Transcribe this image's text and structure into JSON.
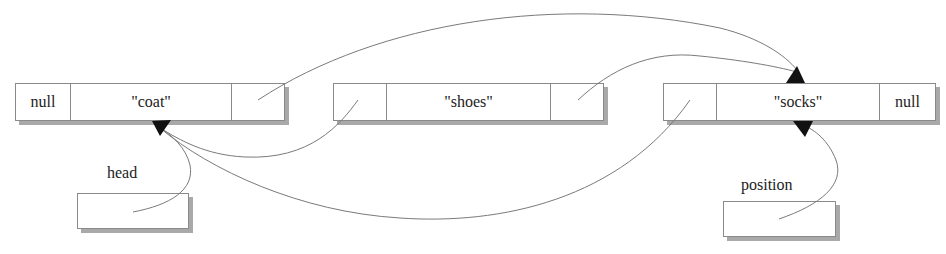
{
  "diagram": {
    "type": "doubly-linked-list",
    "nodes": [
      {
        "id": "coat",
        "prev": "null",
        "value": "\"coat\"",
        "next": ""
      },
      {
        "id": "shoes",
        "prev": "",
        "value": "\"shoes\"",
        "next": ""
      },
      {
        "id": "socks",
        "prev": "",
        "value": "\"socks\"",
        "next": "null"
      }
    ],
    "variables": [
      {
        "name": "head",
        "points_to": "coat"
      },
      {
        "name": "position",
        "points_to": "socks"
      }
    ],
    "links": [
      {
        "from": "coat.next",
        "to": "socks"
      },
      {
        "from": "shoes.next",
        "to": "socks"
      },
      {
        "from": "shoes.prev",
        "to": "coat"
      },
      {
        "from": "socks.prev",
        "to": "coat"
      },
      {
        "from": "head",
        "to": "coat"
      },
      {
        "from": "position",
        "to": "socks"
      }
    ],
    "colors": {
      "line": "#7a7a7a",
      "arrow": "#111111",
      "shadow": "#a9a9a9",
      "border": "#8a8a8a"
    }
  }
}
